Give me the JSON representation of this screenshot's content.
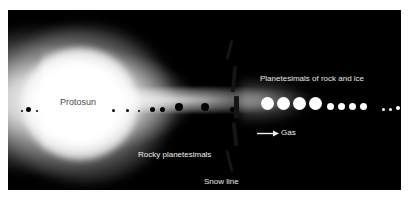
{
  "figure": {
    "panel_background": "#000000",
    "page_background": "#ffffff"
  },
  "labels": {
    "protosun": "Protosun",
    "rocky_planetesimals": "Rocky planetesimals",
    "icy_planetesimals": "Planetesimals of rock and ice",
    "snow_line": "Snow line",
    "gas": "Gas"
  },
  "colors": {
    "rocky_body": "#000000",
    "icy_body": "#ffffff",
    "snow_line_dash": "#151515",
    "glow": "#ffffff",
    "label_dark": "#4a4a4a",
    "label_light": "#f0f0f0"
  },
  "chart_data": {
    "type": "diagram",
    "regions": [
      {
        "name": "protosun",
        "label": "Protosun",
        "cx": 72,
        "cy": 94,
        "radius": 58
      },
      {
        "name": "inner-disk",
        "label": "Rocky planetesimals",
        "extent": [
          8,
          232
        ]
      },
      {
        "name": "snow-line",
        "label": "Snow line",
        "x": 230
      },
      {
        "name": "outer-disk",
        "label": "Planetesimals of rock and ice",
        "extent": [
          240,
          400
        ]
      }
    ],
    "rocky_bodies": [
      {
        "x": 14,
        "y": 101,
        "d": 2
      },
      {
        "x": 20,
        "y": 99,
        "d": 5
      },
      {
        "x": 29,
        "y": 101,
        "d": 2
      },
      {
        "x": 105,
        "y": 100,
        "d": 3
      },
      {
        "x": 119,
        "y": 100,
        "d": 3
      },
      {
        "x": 131,
        "y": 101,
        "d": 2
      },
      {
        "x": 144,
        "y": 99,
        "d": 5
      },
      {
        "x": 154,
        "y": 99,
        "d": 5
      },
      {
        "x": 171,
        "y": 97,
        "d": 8
      },
      {
        "x": 197,
        "y": 97,
        "d": 8
      },
      {
        "x": 224,
        "y": 99,
        "d": 5
      }
    ],
    "icy_bodies": [
      {
        "x": 259,
        "y": 93,
        "d": 13
      },
      {
        "x": 275,
        "y": 93,
        "d": 13
      },
      {
        "x": 291,
        "y": 93,
        "d": 13
      },
      {
        "x": 307,
        "y": 93,
        "d": 13
      },
      {
        "x": 322,
        "y": 96,
        "d": 7
      },
      {
        "x": 333,
        "y": 96,
        "d": 7
      },
      {
        "x": 344,
        "y": 96,
        "d": 7
      },
      {
        "x": 355,
        "y": 96,
        "d": 7
      },
      {
        "x": 375,
        "y": 99,
        "d": 3
      },
      {
        "x": 382,
        "y": 99,
        "d": 3
      },
      {
        "x": 390,
        "y": 98,
        "d": 4
      }
    ],
    "snow_line_dashes": [
      {
        "x": 220,
        "y": 30,
        "w": 3,
        "h": 20,
        "rot": 14
      },
      {
        "x": 224,
        "y": 56,
        "w": 4,
        "h": 26,
        "rot": 6
      },
      {
        "x": 226,
        "y": 86,
        "w": 5,
        "h": 22,
        "rot": 0
      },
      {
        "x": 225,
        "y": 112,
        "w": 4,
        "h": 24,
        "rot": -7
      },
      {
        "x": 220,
        "y": 140,
        "w": 3,
        "h": 22,
        "rot": -14
      }
    ]
  }
}
